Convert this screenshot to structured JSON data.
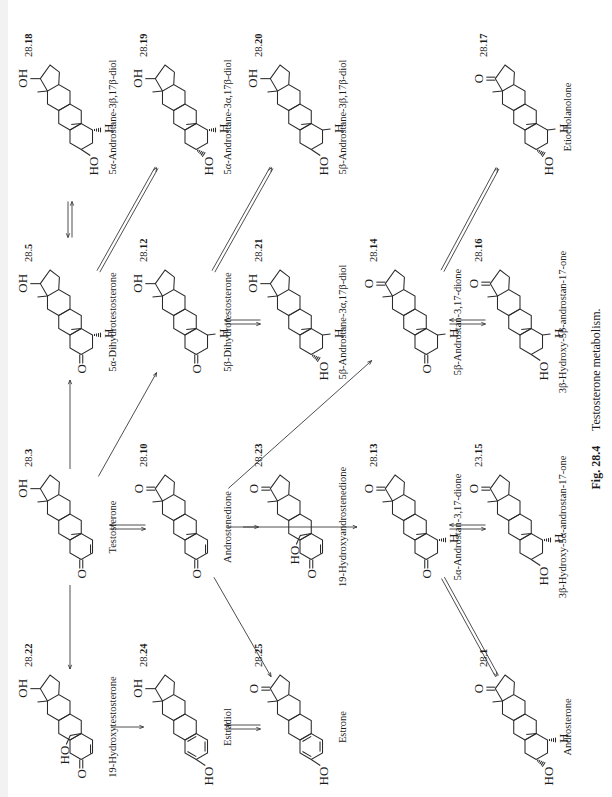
{
  "figure": {
    "number": "Fig. 28.4",
    "title": "Testosterone metabolism.",
    "orientation": "rotated-90-degrees"
  },
  "compounds": [
    {
      "id": "28.22",
      "prefix": "28.",
      "bold": "22",
      "name": "19-Hydroxytestosterone",
      "x": 70,
      "y": 70,
      "c17": "OH",
      "ring_a": "enone",
      "c3": "O",
      "c19": "CH2OH",
      "c5h": ""
    },
    {
      "id": "28.3",
      "prefix": "28.",
      "bold": "3",
      "name": "Testosterone",
      "x": 270,
      "y": 70,
      "c17": "OH",
      "ring_a": "enone",
      "c3": "O",
      "c19": "CH3",
      "c5h": ""
    },
    {
      "id": "28.5",
      "prefix": "28.",
      "bold": "5",
      "name": "5α-Dihydrotestosterone",
      "x": 475,
      "y": 70,
      "c17": "OH",
      "ring_a": "sat",
      "c3": "O",
      "c19": "CH3",
      "c5h": "alpha"
    },
    {
      "id": "28.18",
      "prefix": "28.",
      "bold": "18",
      "name": "5α-Androstane-3β,17β-diol",
      "x": 680,
      "y": 70,
      "c17": "OH",
      "ring_a": "sat",
      "c3": "HO-beta",
      "c19": "CH3",
      "c5h": "alpha"
    },
    {
      "id": "28.24",
      "prefix": "28.",
      "bold": "24",
      "name": "Estradiol",
      "x": 70,
      "y": 185,
      "c17": "OH",
      "ring_a": "aromatic",
      "c3": "HO",
      "c19": "none",
      "c5h": ""
    },
    {
      "id": "28.10",
      "prefix": "28.",
      "bold": "10",
      "name": "Androstenedione",
      "x": 270,
      "y": 185,
      "c17": "O",
      "ring_a": "enone",
      "c3": "O",
      "c19": "CH3",
      "c5h": ""
    },
    {
      "id": "28.12",
      "prefix": "28.",
      "bold": "12",
      "name": "5β-Dihydrotestosterone",
      "x": 475,
      "y": 185,
      "c17": "OH",
      "ring_a": "sat",
      "c3": "O",
      "c19": "CH3",
      "c5h": "beta"
    },
    {
      "id": "28.19",
      "prefix": "28.",
      "bold": "19",
      "name": "5α-Androstane-3α,17β-diol",
      "x": 680,
      "y": 185,
      "c17": "OH",
      "ring_a": "sat",
      "c3": "HO-alpha",
      "c19": "CH3",
      "c5h": "alpha"
    },
    {
      "id": "28.25",
      "prefix": "28.",
      "bold": "25",
      "name": "Estrone",
      "x": 70,
      "y": 300,
      "c17": "O",
      "ring_a": "aromatic",
      "c3": "HO",
      "c19": "none",
      "c5h": ""
    },
    {
      "id": "28.23",
      "prefix": "28.",
      "bold": "23",
      "name": "19-Hydroxyandrostenedione",
      "x": 270,
      "y": 300,
      "c17": "O",
      "ring_a": "enone",
      "c3": "O",
      "c19": "CH2OH",
      "c5h": ""
    },
    {
      "id": "28.21",
      "prefix": "28.",
      "bold": "21",
      "name": "5β-Androstane-3α,17β-diol",
      "x": 475,
      "y": 300,
      "c17": "OH",
      "ring_a": "sat",
      "c3": "HO-alpha",
      "c19": "CH3",
      "c5h": "beta"
    },
    {
      "id": "28.20",
      "prefix": "28.",
      "bold": "20",
      "name": "5β-Androstane-3β,17β-diol",
      "x": 680,
      "y": 300,
      "c17": "OH",
      "ring_a": "sat",
      "c3": "HO-beta",
      "c19": "CH3",
      "c5h": "beta"
    },
    {
      "id": "28.13",
      "prefix": "28.",
      "bold": "13",
      "name": "5α-Androstan-3,17-dione",
      "x": 270,
      "y": 415,
      "c17": "O",
      "ring_a": "sat",
      "c3": "O",
      "c19": "CH3",
      "c5h": "alpha"
    },
    {
      "id": "28.14",
      "prefix": "28.",
      "bold": "14",
      "name": "5β-Androstan-3,17-dione",
      "x": 475,
      "y": 415,
      "c17": "O",
      "ring_a": "sat",
      "c3": "O",
      "c19": "CH3",
      "c5h": "beta"
    },
    {
      "id": "28.15",
      "prefix": "23.",
      "bold": "15",
      "name": "3β-Hydroxy-5α-androstan-17-one",
      "x": 270,
      "y": 520,
      "c17": "O",
      "ring_a": "sat",
      "c3": "HO-beta",
      "c19": "CH3",
      "c5h": "alpha"
    },
    {
      "id": "28.16",
      "prefix": "28.",
      "bold": "16",
      "name": "3β-Hydroxy-5β-androstan-17-one",
      "x": 475,
      "y": 520,
      "c17": "O",
      "ring_a": "sat",
      "c3": "HO-beta",
      "c19": "CH3",
      "c5h": "beta"
    },
    {
      "id": "28.1",
      "prefix": "28.",
      "bold": "1",
      "name": "Androsterone",
      "x": 70,
      "y": 525,
      "c17": "O",
      "ring_a": "sat",
      "c3": "HO-alpha",
      "c19": "CH3",
      "c5h": "alpha"
    },
    {
      "id": "28.17",
      "prefix": "28.",
      "bold": "17",
      "name": "Etiocholanolone",
      "x": 680,
      "y": 525,
      "c17": "O",
      "ring_a": "sat",
      "c3": "HO-alpha",
      "c19": "CH3",
      "c5h": "beta"
    }
  ],
  "atom_labels": {
    "oh": "OH",
    "ho": "HO",
    "o": "O",
    "h": "H"
  },
  "reactions": [
    {
      "from": "28.3",
      "to": "28.22",
      "type": "single"
    },
    {
      "from": "28.3",
      "to": "28.5",
      "type": "single"
    },
    {
      "from": "28.5",
      "to": "28.18",
      "type": "equilibrium"
    },
    {
      "from": "28.5",
      "to": "28.19",
      "type": "double-line"
    },
    {
      "from": "28.22",
      "to": "28.24",
      "type": "single"
    },
    {
      "from": "28.3",
      "to": "28.10",
      "type": "equilibrium"
    },
    {
      "from": "28.3",
      "to": "28.12",
      "type": "single"
    },
    {
      "from": "28.12",
      "to": "28.20",
      "type": "double-line"
    },
    {
      "from": "28.24",
      "to": "28.25",
      "type": "equilibrium"
    },
    {
      "from": "28.10",
      "to": "28.23",
      "type": "single"
    },
    {
      "from": "28.10",
      "to": "28.25",
      "type": "single"
    },
    {
      "from": "28.12",
      "to": "28.21",
      "type": "equilibrium"
    },
    {
      "from": "28.10",
      "to": "28.13",
      "type": "single"
    },
    {
      "from": "28.10",
      "to": "28.14",
      "type": "single"
    },
    {
      "from": "28.14",
      "to": "28.17",
      "type": "double-line"
    },
    {
      "from": "28.13",
      "to": "28.15",
      "type": "equilibrium"
    },
    {
      "from": "28.14",
      "to": "28.16",
      "type": "equilibrium"
    },
    {
      "from": "28.13",
      "to": "28.1",
      "type": "double-line"
    }
  ]
}
